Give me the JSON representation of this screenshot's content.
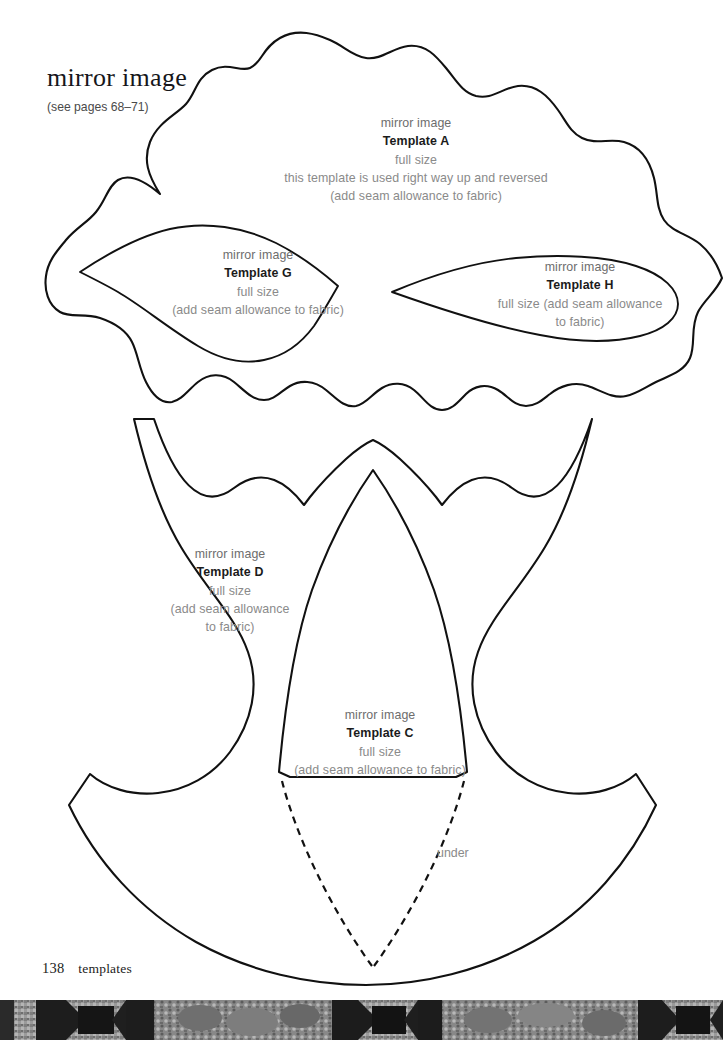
{
  "page": {
    "heading": "mirror image",
    "heading_note": "(see pages 68–71)",
    "folio_number": "138",
    "section_label": "templates",
    "under_label": "under",
    "paper_color": "#ffffff",
    "ink_color": "#111111",
    "caption_color": "#6d6d6d"
  },
  "templates": [
    {
      "id": "A",
      "mirror_label": "mirror image",
      "name": "Template A",
      "size_label": "full size",
      "usage_note": "this template is used right way up and reversed",
      "seam_note": "(add seam allowance to fabric)"
    },
    {
      "id": "G",
      "mirror_label": "mirror image",
      "name": "Template G",
      "size_label": "full size",
      "seam_note": "(add seam allowance to fabric)"
    },
    {
      "id": "H",
      "mirror_label": "mirror image",
      "name": "Template H",
      "size_note_line1": "full size (add seam allowance",
      "size_note_line2": "to fabric)"
    },
    {
      "id": "D",
      "mirror_label": "mirror image",
      "name": "Template D",
      "size_label": "full size",
      "seam_note_line1": "(add seam allowance",
      "seam_note_line2": "to fabric)"
    },
    {
      "id": "C",
      "mirror_label": "mirror image",
      "name": "Template C",
      "size_label": "full size",
      "seam_note": "(add seam allowance to fabric)"
    }
  ]
}
